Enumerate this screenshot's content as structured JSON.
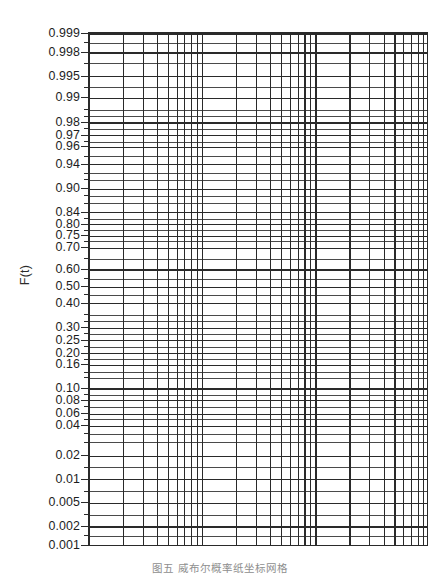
{
  "figure": {
    "kind": "weibull-probability-paper",
    "caption": "图五  威布尔概率纸坐标网格",
    "background_color": "#ffffff",
    "line_color": "#2a2a2a"
  },
  "yaxis": {
    "title": "F(t)",
    "labels": [
      {
        "text": "0.999",
        "y": 33
      },
      {
        "text": "0.998",
        "y": 54
      },
      {
        "text": "0.995",
        "y": 80
      },
      {
        "text": "0.99",
        "y": 104
      },
      {
        "text": "0.98",
        "y": 131
      },
      {
        "text": "0.97",
        "y": 145
      },
      {
        "text": "0.96",
        "y": 158
      },
      {
        "text": "0.94",
        "y": 177
      },
      {
        "text": "0.90",
        "y": 204
      },
      {
        "text": "0.84",
        "y": 230
      },
      {
        "text": "0.80",
        "y": 243
      },
      {
        "text": "0.75",
        "y": 256
      },
      {
        "text": "0.70",
        "y": 269
      },
      {
        "text": "0.60",
        "y": 293
      },
      {
        "text": "0.50",
        "y": 312
      },
      {
        "text": "0.40",
        "y": 330
      },
      {
        "text": "0.30",
        "y": 357
      },
      {
        "text": "0.25",
        "y": 371
      },
      {
        "text": "0.20",
        "y": 385
      },
      {
        "text": "0.16",
        "y": 398
      },
      {
        "text": "0.10",
        "y": 424
      },
      {
        "text": "0.08",
        "y": 437
      },
      {
        "text": "0.06",
        "y": 452
      },
      {
        "text": "0.04",
        "y": 465
      },
      {
        "text": "0.02",
        "y": 498
      },
      {
        "text": "0.01",
        "y": 524
      },
      {
        "text": "0.005",
        "y": 550
      },
      {
        "text": "0.002",
        "y": 576
      },
      {
        "text": "0.001",
        "y": 597
      }
    ],
    "minor_ticks_y": [
      43,
      66,
      92,
      117,
      124,
      138,
      152,
      168,
      187,
      194,
      212,
      220,
      237,
      250,
      262,
      281,
      303,
      321,
      343,
      350,
      364,
      378,
      392,
      406,
      412,
      431,
      444,
      458,
      474,
      483,
      511,
      537,
      563,
      586
    ],
    "range_label": [
      "0.001",
      "0.999"
    ]
  },
  "xaxis": {
    "scale": "logarithmic",
    "cycles": 3,
    "decade_boundaries_px": [
      0,
      113.5,
      227,
      340
    ],
    "minor_mantissas": [
      2,
      3,
      4,
      5,
      6,
      7,
      8,
      9
    ],
    "tick_labels": []
  },
  "chart_data": {
    "type": "line",
    "title": "",
    "subtitle": "",
    "xlabel": "",
    "ylabel": "F(t)",
    "grid": true,
    "legend": "none",
    "x": [],
    "series": [],
    "x_scale": "log",
    "x_cycles": 3,
    "y_scale": "weibull",
    "y_tick_values": [
      0.999,
      0.998,
      0.995,
      0.99,
      0.98,
      0.97,
      0.96,
      0.94,
      0.9,
      0.84,
      0.8,
      0.75,
      0.7,
      0.6,
      0.5,
      0.4,
      0.3,
      0.25,
      0.2,
      0.16,
      0.1,
      0.08,
      0.06,
      0.04,
      0.02,
      0.01,
      0.005,
      0.002,
      0.001
    ],
    "ylim": [
      0.001,
      0.999
    ]
  }
}
